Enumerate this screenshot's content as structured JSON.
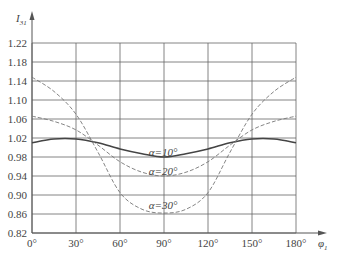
{
  "chart_data": {
    "type": "line",
    "title": "",
    "xlabel": "φ1",
    "ylabel": "I31",
    "xlim": [
      0,
      180
    ],
    "ylim": [
      0.82,
      1.22
    ],
    "grid": true,
    "x": [
      0,
      15,
      30,
      45,
      60,
      75,
      90,
      105,
      120,
      135,
      150,
      165,
      180
    ],
    "x_ticks": [
      "0°",
      "30°",
      "60°",
      "90°",
      "120°",
      "150°",
      "180°"
    ],
    "y_ticks": [
      "0.82",
      "0.86",
      "0.90",
      "0.94",
      "0.98",
      "1.02",
      "1.06",
      "1.10",
      "1.14",
      "1.18",
      "1.22"
    ],
    "series": [
      {
        "name": "α=10°",
        "style": "solid",
        "values": [
          1.01,
          1.018,
          1.018,
          1.01,
          0.997,
          0.987,
          0.98,
          0.987,
          0.997,
          1.01,
          1.018,
          1.018,
          1.01
        ]
      },
      {
        "name": "α=20°",
        "style": "dashed",
        "values": [
          1.066,
          1.055,
          1.037,
          1.005,
          0.97,
          0.948,
          0.94,
          0.948,
          0.97,
          1.005,
          1.037,
          1.055,
          1.066
        ]
      },
      {
        "name": "α=30°",
        "style": "dashed",
        "values": [
          1.148,
          1.118,
          1.07,
          0.99,
          0.905,
          0.87,
          0.862,
          0.87,
          0.905,
          0.99,
          1.07,
          1.118,
          1.148
        ]
      }
    ],
    "annotations": [
      {
        "text": "α=10°",
        "x": 90,
        "y": 0.99
      },
      {
        "text": "α=20°",
        "x": 90,
        "y": 0.95
      },
      {
        "text": "α=30°",
        "x": 90,
        "y": 0.88
      }
    ]
  },
  "labels": {
    "ylabel_main": "I",
    "ylabel_sub": "31",
    "xlabel_main": "φ",
    "xlabel_sub": "1"
  }
}
